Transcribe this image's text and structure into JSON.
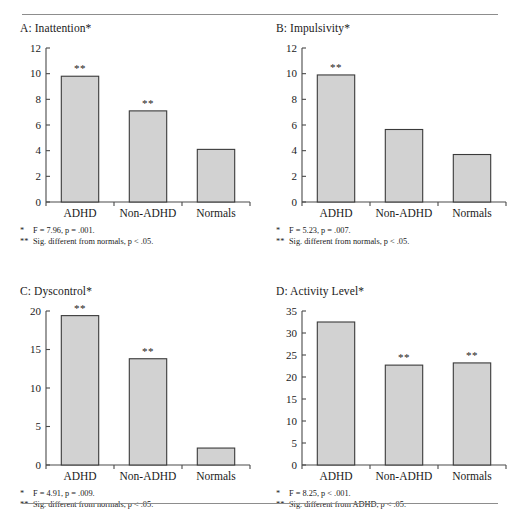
{
  "figure": {
    "rule_color": "#8d8d8d",
    "bar_fill": "#d2d2d2",
    "bar_stroke": "#3a3a3a",
    "axis_color": "#4a4a4a"
  },
  "chart_data": [
    {
      "id": "A",
      "type": "bar",
      "title": "A: Inattention*",
      "categories": [
        "ADHD",
        "Non-ADHD",
        "Normals"
      ],
      "values": [
        9.8,
        7.1,
        4.1
      ],
      "annotations": [
        "**",
        "**",
        ""
      ],
      "xlabel": "",
      "ylabel": "",
      "ylim": [
        0,
        12
      ],
      "yticks": [
        0,
        2,
        4,
        6,
        8,
        10,
        12
      ],
      "grid": false,
      "legend": "none",
      "notes": [
        {
          "mark": "*",
          "text": "F = 7.96, p = .001."
        },
        {
          "mark": "**",
          "text": "Sig. different from normals, p < .05."
        }
      ]
    },
    {
      "id": "B",
      "type": "bar",
      "title": "B: Impulsivity*",
      "categories": [
        "ADHD",
        "Non-ADHD",
        "Normals"
      ],
      "values": [
        9.9,
        5.65,
        3.7
      ],
      "annotations": [
        "**",
        "",
        ""
      ],
      "xlabel": "",
      "ylabel": "",
      "ylim": [
        0,
        12
      ],
      "yticks": [
        0,
        2,
        4,
        6,
        8,
        10,
        12
      ],
      "grid": false,
      "legend": "none",
      "notes": [
        {
          "mark": "*",
          "text": "F = 5.23, p = .007."
        },
        {
          "mark": "**",
          "text": "Sig. different from normals, p < .05."
        }
      ]
    },
    {
      "id": "C",
      "type": "bar",
      "title": "C: Dyscontrol*",
      "categories": [
        "ADHD",
        "Non-ADHD",
        "Normals"
      ],
      "values": [
        19.4,
        13.8,
        2.2
      ],
      "annotations": [
        "**",
        "**",
        ""
      ],
      "xlabel": "",
      "ylabel": "",
      "ylim": [
        0,
        20
      ],
      "yticks": [
        0,
        5,
        10,
        15,
        20
      ],
      "grid": false,
      "legend": "none",
      "notes": [
        {
          "mark": "*",
          "text": "F = 4.91, p = .009."
        },
        {
          "mark": "**",
          "text": "Sig. different from normals, p < .05."
        }
      ]
    },
    {
      "id": "D",
      "type": "bar",
      "title": "D: Activity Level*",
      "categories": [
        "ADHD",
        "Non-ADHD",
        "Normals"
      ],
      "values": [
        32.5,
        22.7,
        23.2
      ],
      "annotations": [
        "",
        "**",
        "**"
      ],
      "xlabel": "",
      "ylabel": "",
      "ylim": [
        0,
        35
      ],
      "yticks": [
        0,
        5,
        10,
        15,
        20,
        25,
        30,
        35
      ],
      "grid": false,
      "legend": "none",
      "notes": [
        {
          "mark": "*",
          "text": "F = 8.25, p < .001."
        },
        {
          "mark": "**",
          "text": "Sig. different from ADHD, p < .05."
        }
      ]
    }
  ]
}
